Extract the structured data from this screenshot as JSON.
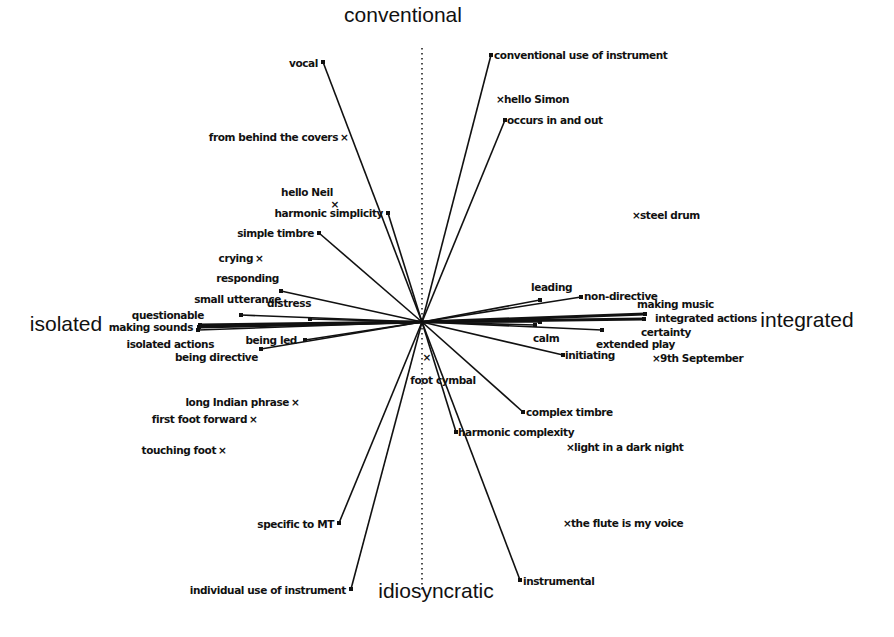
{
  "diagram": {
    "type": "repertory-grid-biplot",
    "center": {
      "x": 422,
      "y": 322
    },
    "axes": {
      "top": {
        "label": "conventional",
        "x": 403,
        "y": 22
      },
      "bottom": {
        "label": "idiosyncratic",
        "x": 436,
        "y": 598
      },
      "left": {
        "label": "isolated",
        "x": 66,
        "y": 331
      },
      "right": {
        "label": "integrated",
        "x": 807,
        "y": 327
      }
    },
    "vertical_axis": {
      "x": 422,
      "y1": 48,
      "y2": 590
    },
    "constructs": [
      {
        "label": "vocal",
        "end": {
          "x": 323,
          "y": 62
        },
        "label_pos": {
          "x": 318,
          "y": 67,
          "anchor": "end"
        }
      },
      {
        "label": "conventional use of instrument",
        "end": {
          "x": 491,
          "y": 55
        },
        "label_pos": {
          "x": 494,
          "y": 59,
          "anchor": "start"
        }
      },
      {
        "label": "occurs in and out",
        "end": {
          "x": 505,
          "y": 120
        },
        "label_pos": {
          "x": 507,
          "y": 124,
          "anchor": "start"
        }
      },
      {
        "label": "harmonic simplicity",
        "end": {
          "x": 388,
          "y": 213
        },
        "label_pos": {
          "x": 383,
          "y": 217,
          "anchor": "end"
        }
      },
      {
        "label": "simple timbre",
        "end": {
          "x": 319,
          "y": 233
        },
        "label_pos": {
          "x": 314,
          "y": 237,
          "anchor": "end"
        }
      },
      {
        "label": "responding",
        "end": {
          "x": 281,
          "y": 291
        },
        "label_pos": {
          "x": 279,
          "y": 282,
          "anchor": "end"
        }
      },
      {
        "label": "small utterance",
        "end": {
          "x": 241,
          "y": 315
        },
        "label_pos": {
          "x": 281,
          "y": 303,
          "anchor": "end"
        }
      },
      {
        "label": "distress",
        "end": {
          "x": 310,
          "y": 319
        },
        "label_pos": {
          "x": 267,
          "y": 307,
          "anchor": "start"
        }
      },
      {
        "label": "questionable",
        "end": {
          "x": 200,
          "y": 325
        },
        "label_pos": {
          "x": 204,
          "y": 319,
          "anchor": "end"
        },
        "thick": true
      },
      {
        "label": "making sounds",
        "end": {
          "x": 199,
          "y": 327
        },
        "label_pos": {
          "x": 193,
          "y": 331,
          "anchor": "end"
        },
        "thick": true
      },
      {
        "label": "isolated actions",
        "end": {
          "x": 198,
          "y": 330
        },
        "label_pos": {
          "x": 214,
          "y": 348,
          "anchor": "end"
        }
      },
      {
        "label": "being led",
        "end": {
          "x": 305,
          "y": 340
        },
        "label_pos": {
          "x": 297,
          "y": 344,
          "anchor": "end"
        }
      },
      {
        "label": "being directive",
        "end": {
          "x": 261,
          "y": 349
        },
        "label_pos": {
          "x": 258,
          "y": 361,
          "anchor": "end"
        }
      },
      {
        "label": "leading",
        "end": {
          "x": 540,
          "y": 300
        },
        "label_pos": {
          "x": 531,
          "y": 291,
          "anchor": "start"
        }
      },
      {
        "label": "non-directive",
        "end": {
          "x": 581,
          "y": 297
        },
        "label_pos": {
          "x": 584,
          "y": 300,
          "anchor": "start"
        }
      },
      {
        "label": "making music",
        "end": {
          "x": 645,
          "y": 314
        },
        "label_pos": {
          "x": 637,
          "y": 308,
          "anchor": "start"
        },
        "thick": true
      },
      {
        "label": "integrated actions",
        "end": {
          "x": 644,
          "y": 319
        },
        "label_pos": {
          "x": 655,
          "y": 322,
          "anchor": "start"
        },
        "thick": true
      },
      {
        "label": "certainty",
        "end": {
          "x": 602,
          "y": 330
        },
        "label_pos": {
          "x": 641,
          "y": 336,
          "anchor": "start"
        }
      },
      {
        "label": "calm",
        "end": {
          "x": 535,
          "y": 325
        },
        "label_pos": {
          "x": 533,
          "y": 342,
          "anchor": "start"
        }
      },
      {
        "label": "extended play",
        "end": {
          "x": 540,
          "y": 322
        },
        "label_pos": {
          "x": 596,
          "y": 348,
          "anchor": "start"
        }
      },
      {
        "label": "initiating",
        "end": {
          "x": 563,
          "y": 355
        },
        "label_pos": {
          "x": 565,
          "y": 359,
          "anchor": "start"
        }
      },
      {
        "label": "complex timbre",
        "end": {
          "x": 523,
          "y": 412
        },
        "label_pos": {
          "x": 526,
          "y": 416,
          "anchor": "start"
        }
      },
      {
        "label": "harmonic complexity",
        "end": {
          "x": 456,
          "y": 432
        },
        "label_pos": {
          "x": 458,
          "y": 436,
          "anchor": "start"
        }
      },
      {
        "label": "instrumental",
        "end": {
          "x": 520,
          "y": 580
        },
        "label_pos": {
          "x": 523,
          "y": 585,
          "anchor": "start"
        }
      },
      {
        "label": "specific to MT",
        "end": {
          "x": 339,
          "y": 523
        },
        "label_pos": {
          "x": 334,
          "y": 528,
          "anchor": "end"
        }
      },
      {
        "label": "individual use of instrument",
        "end": {
          "x": 351,
          "y": 589
        },
        "label_pos": {
          "x": 346,
          "y": 594,
          "anchor": "end"
        }
      }
    ],
    "elements": [
      {
        "label": "from behind the covers",
        "mark_pos": "after",
        "x": 338,
        "y": 141
      },
      {
        "label": "hello Neil",
        "mark_pos": "below",
        "x": 307,
        "y": 196,
        "mark": {
          "x": 335,
          "y": 208
        }
      },
      {
        "label": "crying",
        "mark_pos": "after",
        "x": 253,
        "y": 262
      },
      {
        "label": "hello Simon",
        "mark_pos": "before",
        "x": 496,
        "y": 103
      },
      {
        "label": "steel drum",
        "mark_pos": "before",
        "x": 632,
        "y": 219
      },
      {
        "label": "9th September",
        "mark_pos": "before",
        "x": 652,
        "y": 362
      },
      {
        "label": "foot cymbal",
        "mark_pos": "above",
        "x": 443,
        "y": 384,
        "mark": {
          "x": 427,
          "y": 361
        }
      },
      {
        "label": "long Indian phrase",
        "mark_pos": "after",
        "x": 289,
        "y": 406
      },
      {
        "label": "first foot forward",
        "mark_pos": "after",
        "x": 247,
        "y": 423
      },
      {
        "label": "touching foot",
        "mark_pos": "after",
        "x": 216,
        "y": 454
      },
      {
        "label": "light in a dark night",
        "mark_pos": "before",
        "x": 566,
        "y": 451
      },
      {
        "label": "the flute is my voice",
        "mark_pos": "before",
        "x": 563,
        "y": 527
      }
    ],
    "element_marker_glyph": "×"
  }
}
